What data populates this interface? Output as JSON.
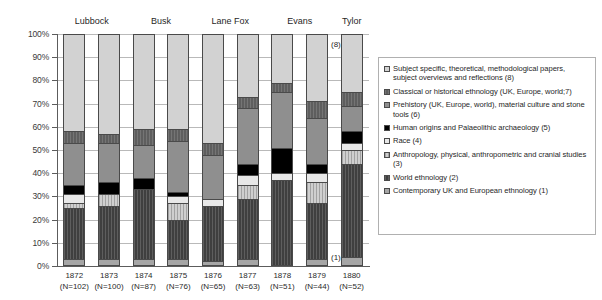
{
  "chart_data": {
    "type": "bar",
    "subtype": "100% stacked column",
    "title": "",
    "xlabel": "",
    "ylabel": "",
    "ylim": [
      0,
      100
    ],
    "ytick_labels": [
      "0%",
      "10%",
      "20%",
      "30%",
      "40%",
      "50%",
      "60%",
      "70%",
      "80%",
      "90%",
      "100%"
    ],
    "ytick_values": [
      0,
      10,
      20,
      30,
      40,
      50,
      60,
      70,
      80,
      90,
      100
    ],
    "grid": true,
    "legend_position": "right",
    "categories": [
      "1872",
      "1873",
      "1874",
      "1875",
      "1876",
      "1877",
      "1878",
      "1879",
      "1880"
    ],
    "category_counts": [
      "(N=102)",
      "(N=100)",
      "(N=87)",
      "(N=76)",
      "(N=65)",
      "(N=63)",
      "(N=51)",
      "(N=44)",
      "(N=52)"
    ],
    "group_labels": [
      "Lubbock",
      "Busk",
      "Lane Fox",
      "Evans",
      "Tylor"
    ],
    "series": [
      {
        "name": "Contemporary UK and European ethnology (1)",
        "key": "c1",
        "values": [
          3,
          3,
          3,
          3,
          2,
          3,
          0,
          3,
          4
        ]
      },
      {
        "name": "World ethnology (2)",
        "key": "c2",
        "values": [
          22,
          23,
          30,
          17,
          24,
          26,
          37,
          24,
          40
        ]
      },
      {
        "name": "Anthropology, physical, anthropometric and cranial studies (3)",
        "key": "c3",
        "values": [
          2,
          5,
          0,
          7,
          0,
          6,
          0,
          9,
          6
        ]
      },
      {
        "name": "Race (4)",
        "key": "c4",
        "values": [
          4,
          0,
          0,
          3,
          3,
          4,
          3,
          4,
          3
        ]
      },
      {
        "name": "Human origins and Palaeolithic archaeology (5)",
        "key": "c5",
        "values": [
          4,
          5,
          5,
          2,
          0,
          5,
          11,
          4,
          5
        ]
      },
      {
        "name": "Prehistory (UK, Europe, world), material culture and stone tools (6)",
        "key": "c6",
        "values": [
          18,
          17,
          14,
          22,
          19,
          24,
          24,
          20,
          11
        ]
      },
      {
        "name": "Classical or historical ethnology (UK, Europe, world;7)",
        "key": "c7",
        "values": [
          5,
          4,
          7,
          5,
          5,
          5,
          4,
          7,
          6
        ]
      },
      {
        "name": "Subject specific, theoretical, methodological papers, subject overviews and reflections (8)",
        "key": "c8",
        "values": [
          42,
          43,
          41,
          41,
          47,
          27,
          21,
          29,
          25
        ]
      }
    ],
    "annotations": [
      {
        "text": "(8)",
        "near": "1879-top"
      },
      {
        "text": "(1)",
        "near": "1879-bottom"
      }
    ]
  },
  "legend": {
    "entries": [
      {
        "swatch": "c8",
        "label": "Subject specific, theoretical, methodological papers, subject overviews and reflections (8)"
      },
      {
        "swatch": "c7",
        "label": "Classical or historical ethnology (UK, Europe, world;7)"
      },
      {
        "swatch": "c6",
        "label": "Prehistory (UK, Europe, world), material culture and stone tools (6)"
      },
      {
        "swatch": "c5",
        "label": "Human origins and Palaeolithic archaeology (5)"
      },
      {
        "swatch": "c4",
        "label": "Race (4)"
      },
      {
        "swatch": "c3",
        "label": "Anthropology, physical, anthropometric and cranial studies (3)"
      },
      {
        "swatch": "c2",
        "label": "World ethnology (2)"
      },
      {
        "swatch": "c1",
        "label": "Contemporary UK and European ethnology (1)"
      }
    ]
  }
}
